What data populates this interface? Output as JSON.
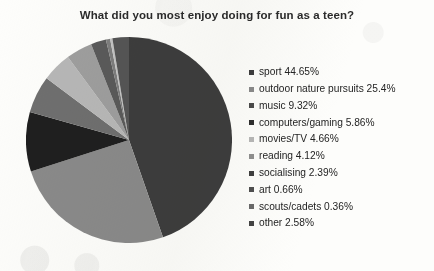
{
  "chart_data": {
    "type": "pie",
    "title": "What did you most enjoy doing for fun as a teen?",
    "xlabel": "",
    "ylabel": "",
    "legend_position": "right",
    "grid": false,
    "start_angle_deg": 0,
    "direction": "clockwise",
    "categories": [
      "sport",
      "outdoor nature pursuits",
      "music",
      "computers/gaming",
      "movies/TV",
      "reading",
      "socialising",
      "art",
      "scouts/cadets",
      "other"
    ],
    "values": [
      44.65,
      25.4,
      9.32,
      5.86,
      4.66,
      4.12,
      2.39,
      0.66,
      0.36,
      2.58
    ],
    "value_suffix": "%",
    "colors": [
      "#3d3d3d",
      "#8a8a8a",
      "#1f1f1f",
      "#6f6f6f",
      "#b7b7b7",
      "#9e9e9e",
      "#5a5a5a",
      "#7d7d7d",
      "#c2c2c2",
      "#555555"
    ],
    "legend_entries": [
      {
        "label": "sport 44.65%",
        "color": "#3d3d3d"
      },
      {
        "label": "outdoor nature pursuits 25.4%",
        "color": "#8a8a8a"
      },
      {
        "label": "music 9.32%",
        "color": "#4a4a4a"
      },
      {
        "label": "computers/gaming 5.86%",
        "color": "#2e2e2e"
      },
      {
        "label": "movies/TV 4.66%",
        "color": "#b7b7b7"
      },
      {
        "label": "reading 4.12%",
        "color": "#8f8f8f"
      },
      {
        "label": "socialising 2.39%",
        "color": "#3f3f3f"
      },
      {
        "label": "art 0.66%",
        "color": "#4f4f4f"
      },
      {
        "label": "scouts/cadets 0.36%",
        "color": "#6a6a6a"
      },
      {
        "label": "other 2.58%",
        "color": "#444444"
      }
    ]
  },
  "title_color": "#2b2b2b",
  "background_color": "#fdfdfb"
}
